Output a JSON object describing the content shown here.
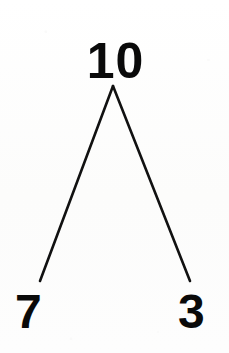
{
  "figure": {
    "type": "number-bond",
    "background_color": "#fdfdfc",
    "stroke_color": "#111111",
    "text_color": "#0a0a0a",
    "stroke_width": 2.6
  },
  "chart_data": {
    "type": "diagram",
    "diagram_kind": "number-bond",
    "title": "",
    "whole": 10,
    "parts": [
      7,
      3
    ],
    "relationship": "7 + 3 = 10",
    "nodes": [
      {
        "id": "whole",
        "label": "10",
        "role": "whole",
        "x": 113,
        "y": 59,
        "value": 10
      },
      {
        "id": "part-left",
        "label": "7",
        "role": "part",
        "x": 31,
        "y": 309,
        "value": 7
      },
      {
        "id": "part-right",
        "label": "3",
        "role": "part",
        "x": 194,
        "y": 309,
        "value": 3
      }
    ],
    "edges": [
      {
        "from": "whole",
        "to": "part-left",
        "x1": 113,
        "y1": 86,
        "x2": 40,
        "y2": 281
      },
      {
        "from": "whole",
        "to": "part-right",
        "x1": 113,
        "y1": 86,
        "x2": 190,
        "y2": 281
      }
    ],
    "apex": {
      "x": 113,
      "y": 86
    },
    "legend": [],
    "grid": false
  },
  "labels": {
    "whole": "10",
    "part_left": "7",
    "part_right": "3"
  }
}
